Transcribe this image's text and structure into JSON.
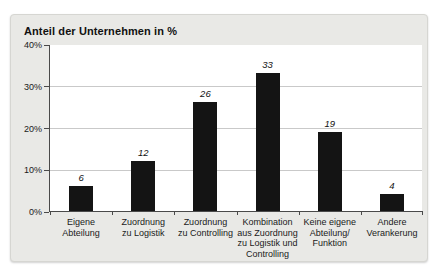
{
  "page": {
    "background": "#ffffff"
  },
  "card": {
    "background": "#e9e9e6",
    "border_color": "#d6d6d2"
  },
  "chart_data": {
    "type": "bar",
    "title": "Anteil der Unternehmen in %",
    "categories": [
      "Eigene\nAbteilung",
      "Zuordnung\nzu Logistik",
      "Zuordnung\nzu Controlling",
      "Kombination\naus Zuordnung\nzu Logistik und\nControlling",
      "Keine eigene\nAbteilung/\nFunktion",
      "Andere\nVerankerung"
    ],
    "values": [
      6,
      12,
      26,
      33,
      19,
      4
    ],
    "value_labels": [
      "6",
      "12",
      "26",
      "33",
      "19",
      "4"
    ],
    "xlabel": "",
    "ylabel": "",
    "ylim": [
      0,
      40
    ],
    "ytick_values": [
      0,
      10,
      20,
      30,
      40
    ],
    "ytick_labels": [
      "0%",
      "10%",
      "20%",
      "30%",
      "40%"
    ],
    "grid": true,
    "legend": false,
    "value_labels_style": "italic",
    "bar_color": "#141414",
    "axis_color": "#4a4a4a",
    "gridline_color": "#c9c9c9",
    "plot_background": "#ffffff",
    "text_color": "#1a1a1a"
  }
}
